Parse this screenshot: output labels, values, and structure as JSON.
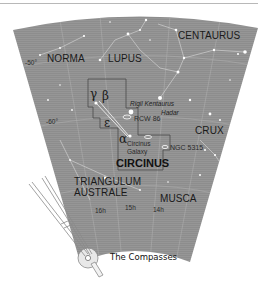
{
  "chart": {
    "title": "CIRCINUS",
    "constellations": {
      "centaurus": "CENTAURUS",
      "norma": "NORMA",
      "lupus": "LUPUS",
      "crux": "CRUX",
      "circinus": "CIRCINUS",
      "triangulum_1": "TRIANGULUM",
      "triangulum_2": "AUSTRALE",
      "musca": "MUSCA"
    },
    "declination": {
      "d50": "-50°",
      "d60": "-60°"
    },
    "right_ascension": {
      "h16": "16h",
      "h15": "15h",
      "h14": "14h"
    },
    "stars": {
      "gamma": "γ",
      "beta": "β",
      "epsilon": "ε",
      "alpha": "α",
      "rigil": "Rigil Kentaurus",
      "hadar": "Hadar"
    },
    "objects": {
      "rcw86": "RCW 86",
      "circinus_galaxy_1": "Circinus",
      "circinus_galaxy_2": "Galaxy",
      "ngc5315": "NGC 5315"
    },
    "colors": {
      "sky": "#8f8f8f",
      "text": "#1a1a1a",
      "compass": "#9a9a9a"
    }
  },
  "illustration": {
    "caption": "The Compasses",
    "icon": "compass-drawing-icon"
  }
}
